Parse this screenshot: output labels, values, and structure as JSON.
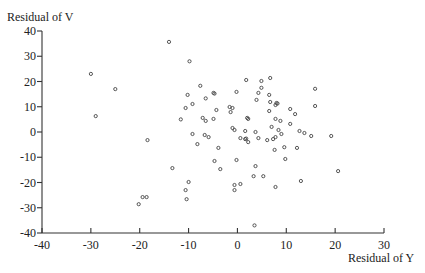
{
  "chart_data": {
    "type": "scatter",
    "title": "",
    "xlabel": "Residual of Y",
    "ylabel": "Residual of V",
    "xlim": [
      -40,
      30
    ],
    "ylim": [
      -40,
      40
    ],
    "xticks": [
      -40,
      -30,
      -20,
      -10,
      0,
      10,
      20,
      30
    ],
    "yticks": [
      -40,
      -30,
      -20,
      -10,
      0,
      10,
      20,
      30,
      40
    ],
    "grid": false,
    "legend": null,
    "marker": "open-circle",
    "points": [
      [
        -30,
        23
      ],
      [
        -25,
        17
      ],
      [
        -29,
        6.3
      ],
      [
        -14,
        35.7
      ],
      [
        -9.8,
        28
      ],
      [
        -7.6,
        18.3
      ],
      [
        -10.2,
        14.7
      ],
      [
        -4.9,
        15.5
      ],
      [
        -4.7,
        15.2
      ],
      [
        -6.5,
        13.3
      ],
      [
        -9.2,
        11.1
      ],
      [
        -10.6,
        9.5
      ],
      [
        -4.3,
        8.7
      ],
      [
        -1.6,
        9.9
      ],
      [
        -1.4,
        7.9
      ],
      [
        -11.6,
        5
      ],
      [
        -7.1,
        5.6
      ],
      [
        -6.5,
        4.4
      ],
      [
        -4.9,
        5.2
      ],
      [
        -1,
        1.6
      ],
      [
        -0.6,
        0.8
      ],
      [
        -9.2,
        -0.8
      ],
      [
        -6.7,
        -1.2
      ],
      [
        -5.9,
        -2
      ],
      [
        -8.2,
        -4.8
      ],
      [
        -18.4,
        -3.2
      ],
      [
        -3.9,
        -6.3
      ],
      [
        -4.7,
        -11.5
      ],
      [
        -0.2,
        -11.1
      ],
      [
        -3.5,
        -14.7
      ],
      [
        -13.3,
        -14.3
      ],
      [
        -10,
        -19.8
      ],
      [
        -10.6,
        -23
      ],
      [
        -10.4,
        -26.6
      ],
      [
        -0.6,
        -21
      ],
      [
        -0.6,
        -23
      ],
      [
        0.6,
        -20.6
      ],
      [
        -19.4,
        -25.8
      ],
      [
        -18.6,
        -25.8
      ],
      [
        -20.2,
        -28.6
      ],
      [
        1.8,
        20.6
      ],
      [
        4.9,
        20.2
      ],
      [
        6.7,
        21.4
      ],
      [
        -0.2,
        15.9
      ],
      [
        4.9,
        17.5
      ],
      [
        4.3,
        15.5
      ],
      [
        3.9,
        12.7
      ],
      [
        6.5,
        14.7
      ],
      [
        15.9,
        17.1
      ],
      [
        6.7,
        11.9
      ],
      [
        8,
        11.5
      ],
      [
        8.2,
        11.3
      ],
      [
        7.8,
        10.7
      ],
      [
        10.8,
        9.1
      ],
      [
        15.9,
        10.3
      ],
      [
        11.8,
        7.1
      ],
      [
        6.5,
        8.3
      ],
      [
        2.2,
        5.2
      ],
      [
        7.8,
        5.2
      ],
      [
        8.8,
        4.4
      ],
      [
        10.8,
        3.2
      ],
      [
        1.6,
        0.4
      ],
      [
        7,
        2
      ],
      [
        8.4,
        0.8
      ],
      [
        12.7,
        0.4
      ],
      [
        13.7,
        -0.4
      ],
      [
        15.1,
        -1.6
      ],
      [
        19.2,
        -1.6
      ],
      [
        1.6,
        -2.8
      ],
      [
        1.8,
        -2.6
      ],
      [
        0.6,
        -2.4
      ],
      [
        4.3,
        -2.4
      ],
      [
        2.2,
        -4
      ],
      [
        6.1,
        -3.2
      ],
      [
        7.3,
        -2.8
      ],
      [
        7.8,
        -2
      ],
      [
        9,
        -0.8
      ],
      [
        3.7,
        0
      ],
      [
        -1,
        9.5
      ],
      [
        2,
        5.6
      ],
      [
        7.6,
        -7.1
      ],
      [
        9.6,
        -6
      ],
      [
        12.2,
        -6.3
      ],
      [
        9.8,
        -10.7
      ],
      [
        3.7,
        -13.5
      ],
      [
        3.3,
        -17.5
      ],
      [
        5.3,
        -17.5
      ],
      [
        7.8,
        -21.8
      ],
      [
        13,
        -19.4
      ],
      [
        20.6,
        -15.5
      ],
      [
        3.5,
        -37
      ]
    ]
  },
  "axes": {
    "y_title": "Residual of V",
    "x_title": "Residual of Y"
  },
  "colors": {
    "marker": "#444444",
    "axis": "#333333",
    "background": "#ffffff"
  }
}
